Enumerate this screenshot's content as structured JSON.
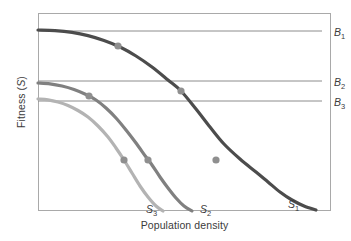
{
  "chart_data": {
    "type": "line",
    "title": "",
    "xlabel": "Population density",
    "ylabel": "Fitness (S)",
    "grid": false,
    "legend_position": "inline-right",
    "axis_ticks": [],
    "xlim": [
      0,
      100
    ],
    "ylim": [
      0,
      100
    ],
    "series": [
      {
        "name": "S1",
        "label_text": "S",
        "label_sub": "1",
        "color": "#4c4c4c",
        "width": 3.2,
        "label_x": 288,
        "label_y": 198,
        "description": "Highest fitness sigmoid decline curve; starts at top, crosses B1, B2, B3",
        "points": [
          [
            38,
            30
          ],
          [
            55,
            30.6
          ],
          [
            72,
            32.4
          ],
          [
            88,
            35.6
          ],
          [
            104,
            40.5
          ],
          [
            120,
            47
          ],
          [
            136,
            56
          ],
          [
            152,
            67
          ],
          [
            168,
            80
          ],
          [
            181,
            91
          ],
          [
            196,
            109
          ],
          [
            210,
            127
          ],
          [
            224,
            144
          ],
          [
            240,
            159
          ],
          [
            256,
            172
          ],
          [
            268,
            182
          ],
          [
            280,
            192
          ],
          [
            292,
            200
          ],
          [
            304,
            206
          ],
          [
            316,
            210
          ]
        ],
        "markers": [
          {
            "x": 118,
            "y": 46,
            "meaning": "intersection with B1"
          },
          {
            "x": 181,
            "y": 91,
            "meaning": "intersection with B2"
          },
          {
            "x": 216,
            "y": 160,
            "meaning": "lower reference point"
          }
        ]
      },
      {
        "name": "S2",
        "label_text": "S",
        "label_sub": "2",
        "color": "#808080",
        "width": 3.2,
        "label_x": 200,
        "label_y": 203,
        "description": "Intermediate fitness decline curve; crosses B3",
        "points": [
          [
            38,
            83
          ],
          [
            50,
            83.8
          ],
          [
            62,
            86
          ],
          [
            74,
            89.5
          ],
          [
            86,
            94.5
          ],
          [
            96,
            100
          ],
          [
            106,
            108
          ],
          [
            116,
            118
          ],
          [
            126,
            130
          ],
          [
            136,
            143
          ],
          [
            146,
            157
          ],
          [
            152,
            165
          ],
          [
            160,
            177
          ],
          [
            168,
            188
          ],
          [
            176,
            198
          ],
          [
            184,
            206
          ],
          [
            192,
            211
          ]
        ],
        "markers": [
          {
            "x": 89,
            "y": 96,
            "meaning": "intersection with B3"
          },
          {
            "x": 148,
            "y": 160,
            "meaning": "lower reference point"
          }
        ]
      },
      {
        "name": "S3",
        "label_text": "S",
        "label_sub": "3",
        "color": "#b3b3b3",
        "width": 3.2,
        "label_x": 146,
        "label_y": 203,
        "description": "Lowest fitness decline curve",
        "points": [
          [
            38,
            99
          ],
          [
            48,
            99.8
          ],
          [
            58,
            102
          ],
          [
            68,
            105.5
          ],
          [
            78,
            110.5
          ],
          [
            88,
            117
          ],
          [
            98,
            126
          ],
          [
            108,
            137
          ],
          [
            116,
            148
          ],
          [
            124,
            160
          ],
          [
            132,
            173
          ],
          [
            140,
            186
          ],
          [
            148,
            197
          ],
          [
            156,
            206
          ],
          [
            163,
            211
          ]
        ],
        "markers": [
          {
            "x": 124,
            "y": 160,
            "meaning": "lower reference point"
          }
        ]
      }
    ],
    "reference_lines": [
      {
        "name": "B1",
        "label_text": "B",
        "label_sub": "1",
        "y": 31,
        "x_start": 38,
        "x_end": 322,
        "color": "#8c8c8c",
        "label_x": 334,
        "label_y": 26,
        "description": "Horizontal birth/benefit reference line 1 (highest)"
      },
      {
        "name": "B2",
        "label_text": "B",
        "label_sub": "2",
        "y": 81,
        "x_start": 38,
        "x_end": 322,
        "color": "#8c8c8c",
        "label_x": 334,
        "label_y": 76,
        "description": "Horizontal birth/benefit reference line 2 (middle)"
      },
      {
        "name": "B3",
        "label_text": "B",
        "label_sub": "3",
        "y": 101,
        "x_start": 38,
        "x_end": 322,
        "color": "#8c8c8c",
        "label_x": 334,
        "label_y": 96,
        "description": "Horizontal birth/benefit reference line 3 (lowest)"
      }
    ],
    "marker_style": {
      "radius": 3.6,
      "color": "#8f8f8f",
      "shape": "circle"
    },
    "frame": {
      "color": "#a9a9a9",
      "left": 38,
      "top": 13,
      "width": 293,
      "height": 198
    },
    "background": "#ffffff"
  }
}
